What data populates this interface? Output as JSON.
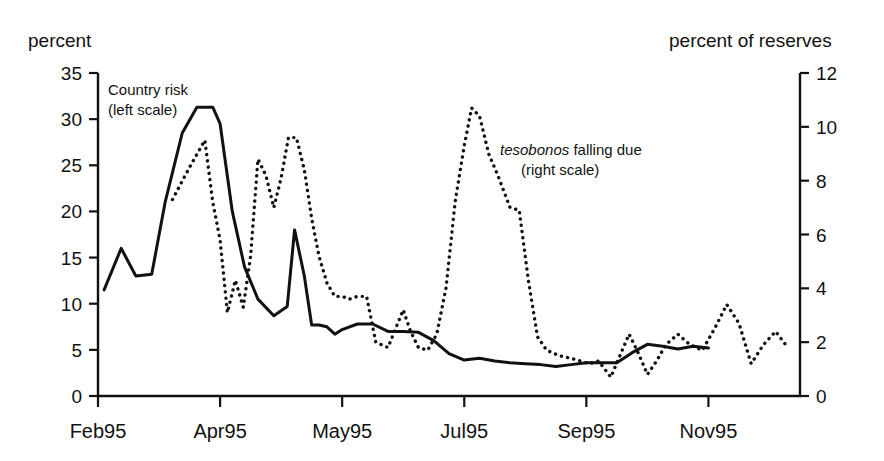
{
  "labels": {
    "left_axis_title": "percent",
    "right_axis_title": "percent of reserves"
  },
  "annotations": {
    "solid": {
      "line1": "Country risk",
      "line2": "(left scale)"
    },
    "dotted": {
      "italic": "tesobonos",
      "rest": " falling due",
      "line2": "(right scale)"
    }
  },
  "chart_data": {
    "type": "line",
    "title": "",
    "subtitle": "",
    "xlabel": "",
    "ylabel": "percent",
    "y2label": "percent of reserves",
    "grid": false,
    "legend": "inline-annotations",
    "xlim": [
      0,
      11.5
    ],
    "ylim": [
      0,
      35
    ],
    "y2lim": [
      0,
      12
    ],
    "yticks": [
      0,
      5,
      10,
      15,
      20,
      25,
      30,
      35
    ],
    "y2ticks": [
      0,
      2,
      4,
      6,
      8,
      10,
      12
    ],
    "xticks": [
      0,
      2,
      4,
      6,
      8,
      10
    ],
    "xtick_labels": [
      "Feb95",
      "Apr95",
      "May95",
      "Jul95",
      "Sep95",
      "Nov95"
    ],
    "series": [
      {
        "name": "Country risk",
        "axis": "left",
        "style": "solid",
        "units": "percent",
        "x": [
          0.1,
          0.38,
          0.62,
          0.88,
          1.1,
          1.38,
          1.62,
          1.88,
          2.0,
          2.2,
          2.4,
          2.62,
          2.88,
          3.1,
          3.22,
          3.38,
          3.5,
          3.62,
          3.75,
          3.88,
          4.0,
          4.25,
          4.5,
          4.75,
          5.0,
          5.25,
          5.5,
          5.75,
          6.0,
          6.25,
          6.5,
          6.75,
          7.0,
          7.25,
          7.5,
          7.75,
          8.0,
          8.25,
          8.5,
          8.75,
          9.0,
          9.25,
          9.5,
          9.75,
          10.0
        ],
        "y": [
          11.5,
          16.0,
          13.0,
          13.2,
          21.0,
          28.5,
          31.3,
          31.3,
          29.5,
          20.0,
          14.0,
          10.5,
          8.7,
          9.7,
          18.0,
          13.0,
          7.7,
          7.7,
          7.5,
          6.7,
          7.2,
          7.8,
          7.8,
          7.0,
          7.0,
          6.9,
          6.0,
          4.6,
          3.9,
          4.1,
          3.8,
          3.6,
          3.5,
          3.4,
          3.2,
          3.4,
          3.6,
          3.6,
          3.6,
          4.7,
          5.6,
          5.4,
          5.1,
          5.4,
          5.2
        ]
      },
      {
        "name": "tesobonos falling due",
        "axis": "right",
        "style": "dotted",
        "units": "percent of reserves",
        "x": [
          1.22,
          1.5,
          1.75,
          1.88,
          2.0,
          2.12,
          2.25,
          2.38,
          2.5,
          2.62,
          2.75,
          2.88,
          3.0,
          3.12,
          3.25,
          3.38,
          3.5,
          3.62,
          3.75,
          3.88,
          4.0,
          4.12,
          4.25,
          4.4,
          4.55,
          4.75,
          5.0,
          5.12,
          5.25,
          5.4,
          5.55,
          5.7,
          5.85,
          6.0,
          6.12,
          6.25,
          6.4,
          6.55,
          6.75,
          6.9,
          7.05,
          7.2,
          7.35,
          7.55,
          7.75,
          7.9,
          8.05,
          8.2,
          8.4,
          8.55,
          8.7,
          8.85,
          9.0,
          9.15,
          9.3,
          9.5,
          9.7,
          9.9,
          10.1,
          10.3,
          10.5,
          10.7,
          10.9,
          11.1,
          11.3
        ],
        "y": [
          7.3,
          8.5,
          9.5,
          7.2,
          5.8,
          3.1,
          4.3,
          3.3,
          5.2,
          8.8,
          8.2,
          7.0,
          8.1,
          9.6,
          9.6,
          8.4,
          6.6,
          5.2,
          4.2,
          3.7,
          3.7,
          3.6,
          3.7,
          3.7,
          2.0,
          1.8,
          3.2,
          2.4,
          1.8,
          1.7,
          2.3,
          4.0,
          7.2,
          9.3,
          10.7,
          10.4,
          9.0,
          8.2,
          7.0,
          6.9,
          4.3,
          2.2,
          1.7,
          1.5,
          1.4,
          1.3,
          1.2,
          1.3,
          0.7,
          1.5,
          2.3,
          1.6,
          0.8,
          1.3,
          1.9,
          2.3,
          1.9,
          1.7,
          2.5,
          3.4,
          2.7,
          1.2,
          1.9,
          2.4,
          1.8
        ]
      }
    ]
  }
}
